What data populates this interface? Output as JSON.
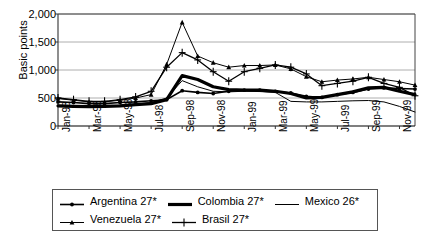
{
  "chart_data": {
    "type": "line",
    "title": "",
    "subtitle": "",
    "xlabel": "",
    "ylabel": "Basic points",
    "ylim": [
      0,
      2000
    ],
    "yticks": [
      "0",
      "500",
      "1,000",
      "1,500",
      "2,000"
    ],
    "ytick_values": [
      0,
      500,
      1000,
      1500,
      2000
    ],
    "grid": true,
    "legend_position": "bottom",
    "x": [
      "Jan-98",
      "Feb-98",
      "Mar-98",
      "Apr-98",
      "May-98",
      "Jun-98",
      "Jul-98",
      "Aug-98",
      "Sep-98",
      "Oct-98",
      "Nov-98",
      "Dec-98",
      "Jan-99",
      "Feb-99",
      "Mar-99",
      "Apr-99",
      "May-99",
      "Jun-99",
      "Jul-99",
      "Aug-99",
      "Sep-99",
      "Oct-99",
      "Nov-99",
      "Dec-99"
    ],
    "xtick_labels": [
      "Jan-98",
      "Mar-98",
      "May-98",
      "Jul-98",
      "Sep-98",
      "Nov-98",
      "Jan-99",
      "Mar-99",
      "May-99",
      "Jul-99",
      "Sep-99",
      "Nov-99"
    ],
    "xtick_indices": [
      0,
      2,
      4,
      6,
      8,
      10,
      12,
      14,
      16,
      18,
      20,
      22
    ],
    "series": [
      {
        "name": "Argentina 27*",
        "marker": "diamond",
        "line_width": 1.6,
        "color": "#000000",
        "values": [
          430,
          420,
          400,
          400,
          420,
          430,
          450,
          470,
          630,
          600,
          580,
          620,
          640,
          640,
          620,
          590,
          530,
          510,
          560,
          600,
          660,
          680,
          670,
          660
        ]
      },
      {
        "name": "Colombia 27*",
        "marker": "none",
        "line_width": 3.2,
        "color": "#000000",
        "values": [
          360,
          350,
          345,
          350,
          360,
          380,
          400,
          470,
          900,
          830,
          700,
          650,
          640,
          640,
          620,
          580,
          500,
          510,
          560,
          610,
          680,
          690,
          620,
          560
        ]
      },
      {
        "name": "Mexico 26*",
        "marker": "none",
        "line_width": 1.0,
        "color": "#000000",
        "values": [
          370,
          360,
          355,
          360,
          370,
          390,
          420,
          500,
          810,
          700,
          620,
          610,
          620,
          615,
          600,
          440,
          430,
          430,
          440,
          450,
          455,
          430,
          350,
          250
        ]
      },
      {
        "name": "Venezuela 27*",
        "marker": "triangle",
        "line_width": 1.0,
        "color": "#000000",
        "values": [
          490,
          460,
          430,
          430,
          460,
          500,
          560,
          1100,
          1850,
          1250,
          1130,
          1050,
          1080,
          1080,
          1090,
          1020,
          880,
          790,
          820,
          840,
          870,
          830,
          790,
          730
        ]
      },
      {
        "name": "Brasil 27*",
        "marker": "plus",
        "line_width": 1.3,
        "color": "#000000",
        "values": [
          500,
          470,
          440,
          440,
          470,
          520,
          620,
          1050,
          1310,
          1180,
          970,
          800,
          970,
          1030,
          1090,
          1050,
          930,
          720,
          760,
          800,
          870,
          760,
          690,
          540
        ]
      }
    ]
  }
}
